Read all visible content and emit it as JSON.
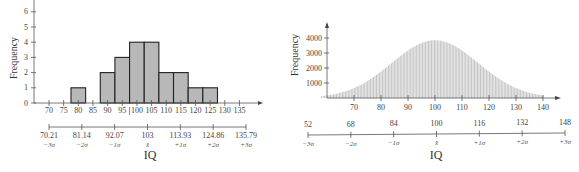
{
  "chart_data": [
    {
      "type": "bar",
      "title": "",
      "xlabel": "IQ",
      "ylabel": "Frequency",
      "ylim": [
        0,
        6
      ],
      "yticks": [
        0,
        1,
        2,
        3,
        4,
        5,
        6
      ],
      "xticks": [
        70,
        75,
        80,
        85,
        90,
        95,
        100,
        105,
        110,
        115,
        120,
        125,
        130,
        135
      ],
      "categories": [
        "80",
        "90",
        "95",
        "100",
        "105",
        "110",
        "115",
        "120",
        "125"
      ],
      "values": [
        1,
        2,
        3,
        4,
        4,
        2,
        2,
        1,
        1
      ],
      "sigma_axis": {
        "values": [
          "70.21",
          "81.14",
          "92.07",
          "103",
          "113.93",
          "124.86",
          "135.79"
        ],
        "labels": [
          "−3σ",
          "−2σ",
          "−1σ",
          "x̄",
          "+1σ",
          "+2σ",
          "+3σ"
        ]
      },
      "grid": false
    },
    {
      "type": "bar",
      "title": "",
      "xlabel": "IQ",
      "ylabel": "Frequency",
      "ylim": [
        0,
        4500
      ],
      "yticks": [
        1000,
        2000,
        3000,
        4000
      ],
      "xticks": [
        70,
        80,
        90,
        100,
        110,
        120,
        130,
        140
      ],
      "description": "Dense normal-shaped histogram of thin vertical bars, mean 100, sd 16, peak about 3850",
      "x": [
        60,
        70,
        80,
        90,
        100,
        110,
        120,
        130,
        136
      ],
      "values": [
        0,
        350,
        1350,
        2950,
        3850,
        2950,
        1350,
        350,
        0
      ],
      "sigma_axis": {
        "values": [
          "52",
          "68",
          "84",
          "100",
          "116",
          "132",
          "148"
        ],
        "labels": [
          "−3σ",
          "−2σ",
          "−1σ",
          "x̄",
          "+1σ",
          "+2σ",
          "+3σ"
        ]
      },
      "grid": false
    }
  ]
}
